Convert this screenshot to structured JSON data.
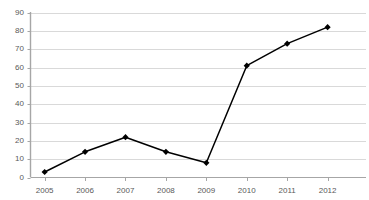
{
  "chart_data": {
    "type": "line",
    "title": "",
    "subtitle": "",
    "xlabel": "",
    "ylabel": "",
    "categories": [
      "2005",
      "2006",
      "2007",
      "2008",
      "2009",
      "2010",
      "2011",
      "2012"
    ],
    "values": [
      3,
      14,
      22,
      14,
      8,
      61,
      73,
      82
    ],
    "series": [
      {
        "name": "",
        "values": [
          3,
          14,
          22,
          14,
          8,
          61,
          73,
          82
        ],
        "line_color": "#000000",
        "marker": "diamond",
        "marker_color": "#000000"
      }
    ],
    "ylim": [
      0,
      90
    ],
    "yticks": [
      0,
      10,
      20,
      30,
      40,
      50,
      60,
      70,
      80,
      90
    ],
    "ytick_labels": [
      "0",
      "10",
      "20",
      "30",
      "40",
      "50",
      "60",
      "70",
      "80",
      "90"
    ],
    "xtick_labels": [
      "2005",
      "2006",
      "2007",
      "2008",
      "2009",
      "2010",
      "2011",
      "2012"
    ],
    "grid": true,
    "grid_axis": "y",
    "grid_color": "#d9d9d9",
    "axis_color": "#a6a6a6",
    "tick_label_color": "#595959",
    "legend": false,
    "legend_position": "none",
    "background_color": "#ffffff"
  }
}
